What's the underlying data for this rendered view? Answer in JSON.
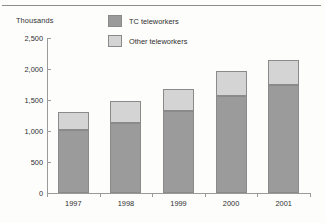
{
  "chart_data": {
    "type": "bar",
    "subtype": "stacked-bar",
    "title": "",
    "xlabel": "",
    "ylabel": "Thousands",
    "categories": [
      "1997",
      "1998",
      "1999",
      "2000",
      "2001"
    ],
    "ylim": [
      0,
      2500
    ],
    "yticks": [
      0,
      500,
      1000,
      1500,
      2000,
      2500
    ],
    "ytick_labels": [
      "0",
      "500",
      "1,000",
      "1,500",
      "2,000",
      "2,500"
    ],
    "grid": false,
    "legend_position": "top-center",
    "series": [
      {
        "name": "TC teleworkers",
        "color": "#9b9b9b",
        "values": [
          1020,
          1130,
          1320,
          1560,
          1745
        ]
      },
      {
        "name": "Other teleworkers",
        "color": "#d4d4d4",
        "values": [
          290,
          360,
          360,
          400,
          405
        ]
      }
    ],
    "totals": [
      1310,
      1490,
      1680,
      1960,
      2150
    ]
  },
  "legend": {
    "items": [
      {
        "label": "TC teleworkers",
        "color": "#9b9b9b"
      },
      {
        "label": "Other teleworkers",
        "color": "#d4d4d4"
      }
    ]
  },
  "axes": {
    "y_title": "Thousands"
  }
}
